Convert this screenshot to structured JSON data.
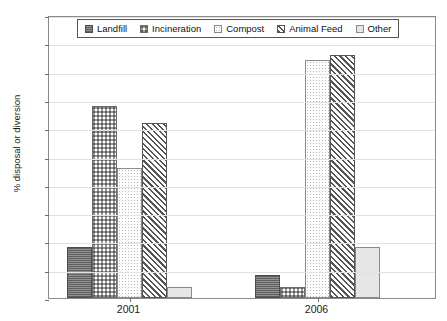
{
  "chart_data": {
    "type": "bar",
    "title": "",
    "xlabel": "",
    "ylabel": "% disposal or diversion",
    "categories": [
      "2001",
      "2006"
    ],
    "ylim": [
      0,
      50
    ],
    "ytick_step": 5,
    "yticks": [
      0,
      5,
      10,
      15,
      20,
      25,
      30,
      35,
      40,
      45,
      50
    ],
    "ytick_labels": [
      "0",
      "5",
      "10",
      "15",
      "20",
      "25",
      "30",
      "35",
      "40",
      "45",
      "50"
    ],
    "grid": true,
    "legend_position": "top-center",
    "series": [
      {
        "name": "Landfill",
        "values": [
          9,
          4
        ],
        "pattern": "dark-horizontal-texture",
        "color": "#787878"
      },
      {
        "name": "Incineration",
        "values": [
          34,
          2
        ],
        "pattern": "checkerboard",
        "color": "#9a9a9a"
      },
      {
        "name": "Compost",
        "values": [
          23,
          42
        ],
        "pattern": "sparse-dots",
        "color": "#fdfdfd"
      },
      {
        "name": "Animal Feed",
        "values": [
          31,
          43
        ],
        "pattern": "diagonal-stripes",
        "color": "#555555"
      },
      {
        "name": "Other",
        "values": [
          2,
          9
        ],
        "pattern": "solid-light",
        "color": "#e6e6e6"
      }
    ]
  },
  "legend": {
    "items": [
      {
        "label": "Landfill"
      },
      {
        "label": "Incineration"
      },
      {
        "label": "Compost"
      },
      {
        "label": "Animal Feed"
      },
      {
        "label": "Other"
      }
    ]
  }
}
